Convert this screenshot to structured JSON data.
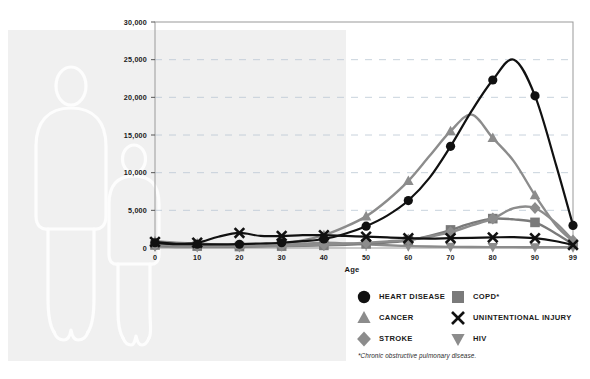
{
  "chart_data": {
    "type": "line",
    "title": "",
    "xlabel": "Age",
    "ylabel": "",
    "xlim": [
      0,
      99
    ],
    "ylim": [
      0,
      30000
    ],
    "grid": true,
    "grid_style": "dashed-horizontal",
    "legend_position": "bottom-right",
    "x_tick_labels": [
      "0",
      "10",
      "20",
      "30",
      "40",
      "50",
      "60",
      "70",
      "80",
      "90",
      "99"
    ],
    "x_ticks": [
      0,
      10,
      20,
      30,
      40,
      50,
      60,
      70,
      80,
      90,
      99
    ],
    "y_tick_labels": [
      "0",
      "5,000",
      "10,000",
      "15,000",
      "20,000",
      "25,000",
      "30,000"
    ],
    "y_ticks": [
      0,
      5000,
      10000,
      15000,
      20000,
      25000,
      30000
    ],
    "x": [
      0,
      5,
      10,
      15,
      20,
      25,
      30,
      35,
      40,
      45,
      50,
      55,
      60,
      65,
      70,
      75,
      80,
      85,
      90,
      95,
      99
    ],
    "series": [
      {
        "name": "HEART DISEASE",
        "marker": "circle",
        "color": "#111111",
        "marker_x": [
          0,
          10,
          20,
          30,
          40,
          50,
          60,
          70,
          80,
          90,
          99
        ],
        "marker_values": [
          700,
          500,
          500,
          700,
          1200,
          2900,
          6300,
          13500,
          22300,
          20200,
          3000
        ],
        "values": [
          700,
          520,
          500,
          480,
          520,
          600,
          700,
          900,
          1200,
          1900,
          2900,
          4300,
          6300,
          9300,
          13500,
          18200,
          22300,
          25000,
          20200,
          11000,
          3000
        ]
      },
      {
        "name": "CANCER",
        "marker": "triangle-up",
        "color": "#8c8c8c",
        "marker_x": [
          0,
          10,
          20,
          30,
          40,
          50,
          60,
          70,
          80,
          90,
          99
        ],
        "marker_values": [
          900,
          600,
          400,
          600,
          1700,
          4200,
          8900,
          15500,
          14600,
          7000,
          900
        ],
        "values": [
          900,
          700,
          600,
          450,
          400,
          450,
          600,
          1000,
          1700,
          2800,
          4200,
          6300,
          8900,
          12200,
          15500,
          17700,
          14600,
          11500,
          7000,
          3000,
          900
        ]
      },
      {
        "name": "STROKE",
        "marker": "diamond",
        "color": "#8c8c8c",
        "marker_x": [
          0,
          10,
          20,
          30,
          40,
          50,
          60,
          70,
          80,
          90,
          99
        ],
        "marker_values": [
          500,
          300,
          250,
          300,
          450,
          700,
          1100,
          2100,
          3900,
          5300,
          1000
        ],
        "values": [
          500,
          350,
          300,
          250,
          250,
          270,
          300,
          360,
          450,
          560,
          700,
          880,
          1100,
          1500,
          2100,
          3000,
          3900,
          5300,
          5300,
          3300,
          1000
        ]
      },
      {
        "name": "COPD*",
        "marker": "square",
        "color": "#7a7a7a",
        "marker_x": [
          0,
          10,
          20,
          30,
          40,
          50,
          60,
          70,
          80,
          90,
          99
        ],
        "marker_values": [
          400,
          250,
          200,
          250,
          350,
          550,
          1000,
          2400,
          3900,
          3400,
          500
        ],
        "values": [
          400,
          280,
          250,
          220,
          200,
          220,
          250,
          290,
          350,
          430,
          550,
          740,
          1000,
          1600,
          2400,
          3300,
          3900,
          3800,
          3400,
          1900,
          500
        ]
      },
      {
        "name": "UNINTENTIONAL INJURY",
        "marker": "x",
        "color": "#111111",
        "marker_x": [
          0,
          10,
          20,
          30,
          40,
          50,
          60,
          70,
          80,
          90,
          99
        ],
        "marker_values": [
          800,
          700,
          2000,
          1600,
          1700,
          1500,
          1300,
          1300,
          1400,
          1300,
          400
        ],
        "values": [
          800,
          550,
          700,
          1500,
          2000,
          1600,
          1600,
          1700,
          1700,
          1600,
          1500,
          1400,
          1300,
          1250,
          1300,
          1350,
          1400,
          1450,
          1300,
          900,
          400
        ]
      },
      {
        "name": "HIV",
        "marker": "triangle-down",
        "color": "#8c8c8c",
        "marker_x": [
          0,
          10,
          20,
          30,
          40,
          50,
          60,
          70,
          80,
          90,
          99
        ],
        "marker_values": [
          200,
          120,
          130,
          400,
          700,
          500,
          250,
          150,
          120,
          100,
          100
        ],
        "values": [
          200,
          140,
          120,
          120,
          130,
          250,
          400,
          560,
          700,
          620,
          500,
          360,
          250,
          190,
          150,
          130,
          120,
          110,
          100,
          100,
          100
        ]
      }
    ]
  },
  "axis": {
    "x_title": "Age"
  },
  "legend": {
    "items": [
      {
        "label": "HEART DISEASE",
        "marker": "circle",
        "color": "#111111",
        "icon_name": "circle-marker-icon"
      },
      {
        "label": "COPD*",
        "marker": "square",
        "color": "#7a7a7a",
        "icon_name": "square-marker-icon"
      },
      {
        "label": "CANCER",
        "marker": "triangle-up",
        "color": "#8c8c8c",
        "icon_name": "triangle-up-marker-icon"
      },
      {
        "label": "UNINTENTIONAL INJURY",
        "marker": "x",
        "color": "#111111",
        "icon_name": "x-marker-icon"
      },
      {
        "label": "STROKE",
        "marker": "diamond",
        "color": "#8c8c8c",
        "icon_name": "diamond-marker-icon"
      },
      {
        "label": "HIV",
        "marker": "triangle-down",
        "color": "#8c8c8c",
        "icon_name": "triangle-down-marker-icon"
      }
    ]
  },
  "footnote": {
    "text": "*Chronic obstructive pulmonary disease."
  },
  "top_sliver": {
    "text": ""
  },
  "colors": {
    "background": "#ffffff",
    "panel": "#f0f0f0",
    "axis": "#999999",
    "grid": "#b9c6d4",
    "dark_series": "#111111",
    "mid_series": "#8c8c8c"
  }
}
